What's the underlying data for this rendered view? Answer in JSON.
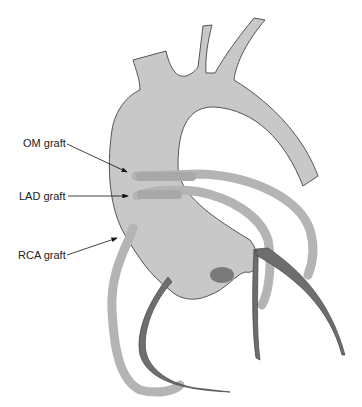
{
  "diagram": {
    "labels": [
      {
        "id": "om",
        "text": "OM graft"
      },
      {
        "id": "lad",
        "text": "LAD graft"
      },
      {
        "id": "rca",
        "text": "RCA graft"
      }
    ],
    "colors": {
      "aorta_fill": "#c8c8c8",
      "outline": "#555555",
      "graft": "#b4b4b4",
      "graft_stump": "#a8a8a8",
      "coronary": "#6e6e6e",
      "arrow": "#111111"
    }
  }
}
